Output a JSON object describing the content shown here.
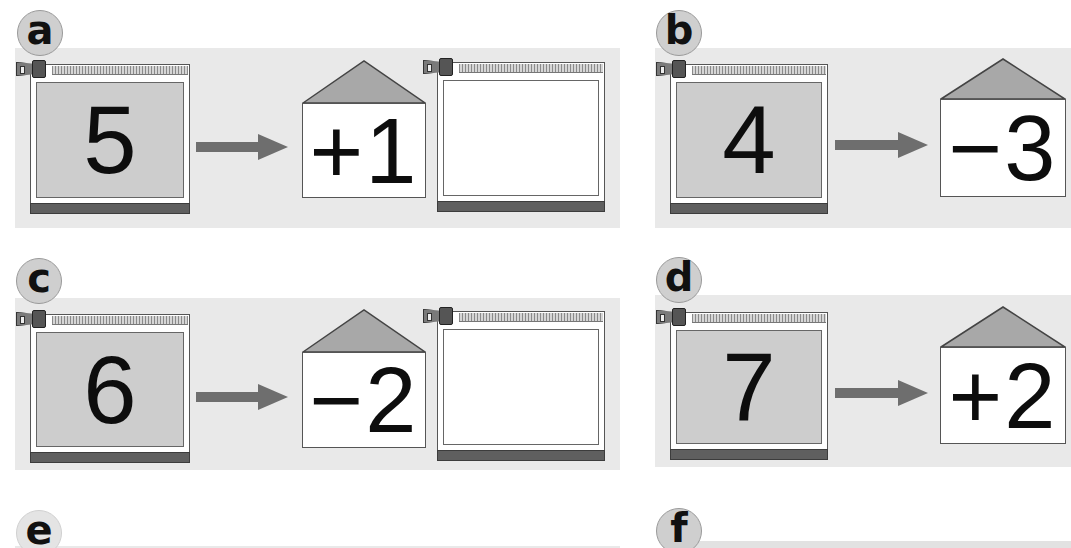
{
  "panels": [
    {
      "label": "a",
      "start_number": "5",
      "operation": "+1",
      "result": ""
    },
    {
      "label": "b",
      "start_number": "4",
      "operation": "−3"
    },
    {
      "label": "c",
      "start_number": "6",
      "operation": "−2",
      "result": ""
    },
    {
      "label": "d",
      "start_number": "7",
      "operation": "+2"
    },
    {
      "label": "e"
    },
    {
      "label": "f"
    }
  ],
  "colors": {
    "strip_background": "#e9e9e9",
    "bag_fill": "#cdcdcd",
    "arrow": "#6e6e6e",
    "roof": "#a8a8a8",
    "bottom_bar": "#5f5f5f"
  }
}
